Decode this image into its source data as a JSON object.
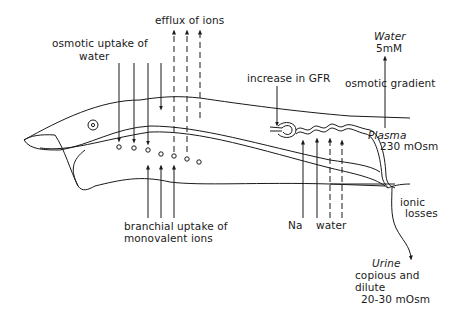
{
  "labels": {
    "efflux": "efflux of ions",
    "osmotic_uptake_line1": "osmotic uptake of",
    "osmotic_uptake_line2": "water",
    "branchial_line1": "branchial uptake of",
    "branchial_line2": "monovalent ions",
    "gfr": "increase in GFR",
    "water_env": "Water",
    "water_env_conc": "5mM",
    "osmotic_gradient": "osmotic gradient",
    "plasma": "Plasma",
    "plasma_conc": "230 mOsm",
    "na": "Na",
    "water_reabs": "water",
    "ionic_line1": "ionic",
    "ionic_line2": "losses",
    "urine": "Urine",
    "urine_line1": "copious and",
    "urine_line2": "dilute",
    "urine_conc": "20-30 mOsm"
  },
  "colors": {
    "ink": "#1a1a1a",
    "background": "#ffffff"
  }
}
